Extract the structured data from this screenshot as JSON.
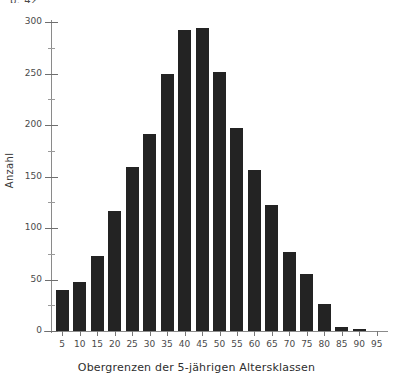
{
  "page": {
    "header_stub": "p. 42"
  },
  "chart_data": {
    "type": "bar",
    "title": "",
    "xlabel": "Obergrenzen der 5-jährigen Altersklassen",
    "ylabel": "Anzahl",
    "categories": [
      "5",
      "10",
      "15",
      "20",
      "25",
      "30",
      "35",
      "40",
      "45",
      "50",
      "55",
      "60",
      "65",
      "70",
      "75",
      "80",
      "85",
      "90",
      "95"
    ],
    "values": [
      40,
      48,
      73,
      117,
      159,
      191,
      250,
      292,
      294,
      251,
      197,
      156,
      122,
      77,
      55,
      26,
      4,
      2,
      0
    ],
    "ylim": [
      0,
      300
    ],
    "yticks": [
      0,
      50,
      100,
      150,
      200,
      250,
      300
    ],
    "yminor": [
      25,
      75,
      125,
      175,
      225,
      275
    ],
    "grid": false,
    "legend": null,
    "bar_color": "#232323"
  }
}
